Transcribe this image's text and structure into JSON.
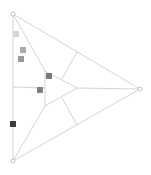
{
  "diagram": {
    "type": "ternary-triangle-with-markers",
    "background": "#ffffff",
    "line_color": "#c8c8c8",
    "vertex_stroke": "#b4b4b4",
    "vertices": [
      {
        "id": "top",
        "x": 13,
        "y": 14
      },
      {
        "id": "right",
        "x": 140,
        "y": 89
      },
      {
        "id": "bottom",
        "x": 13,
        "y": 161
      }
    ],
    "lines": [
      {
        "id": "edge-top-right",
        "x1": 13,
        "y1": 14,
        "x2": 140,
        "y2": 89
      },
      {
        "id": "edge-right-bottom",
        "x1": 140,
        "y1": 89,
        "x2": 13,
        "y2": 161
      },
      {
        "id": "edge-left",
        "x1": 13,
        "y1": 14,
        "x2": 13,
        "y2": 161
      },
      {
        "id": "top-to-inner",
        "x1": 13,
        "y1": 14,
        "x2": 45,
        "y2": 71
      },
      {
        "id": "bottom-to-inner",
        "x1": 13,
        "y1": 161,
        "x2": 45,
        "y2": 106
      },
      {
        "id": "left-mid-to-inner",
        "x1": 13,
        "y1": 87,
        "x2": 45,
        "y2": 88
      },
      {
        "id": "inner-tip-to-right",
        "x1": 77,
        "y1": 88,
        "x2": 140,
        "y2": 89
      },
      {
        "id": "inner-left",
        "x1": 45,
        "y1": 71,
        "x2": 45,
        "y2": 106
      },
      {
        "id": "inner-upper",
        "x1": 45,
        "y1": 71,
        "x2": 77,
        "y2": 88
      },
      {
        "id": "inner-lower",
        "x1": 45,
        "y1": 106,
        "x2": 77,
        "y2": 88
      },
      {
        "id": "tick-upper",
        "x1": 62,
        "y1": 79,
        "x2": 77,
        "y2": 52
      },
      {
        "id": "tick-lower",
        "x1": 62,
        "y1": 98,
        "x2": 77,
        "y2": 125
      }
    ],
    "markers": [
      {
        "id": "marker-1",
        "x": 13,
        "y": 31,
        "size": 6,
        "color": "#d6d6d6"
      },
      {
        "id": "marker-2",
        "x": 20,
        "y": 47,
        "size": 6,
        "color": "#ababab"
      },
      {
        "id": "marker-3",
        "x": 18,
        "y": 56,
        "size": 6,
        "color": "#9a9a9a"
      },
      {
        "id": "marker-4",
        "x": 46,
        "y": 73,
        "size": 6,
        "color": "#7a7a7a"
      },
      {
        "id": "marker-5",
        "x": 37,
        "y": 87,
        "size": 6,
        "color": "#808080"
      },
      {
        "id": "marker-6",
        "x": 10,
        "y": 121,
        "size": 6,
        "color": "#3c3c3c"
      }
    ]
  }
}
